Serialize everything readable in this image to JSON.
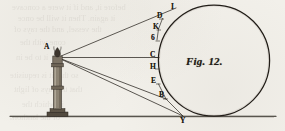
{
  "figure": {
    "caption": "Fig. 12",
    "caption_tail": ".",
    "domain_kind": "engraved-optics-diagram",
    "colors": {
      "paper": "#f2f0ea",
      "ink": "#1b1712",
      "ink_soft": "#3a322a",
      "bleed": "#4a3f34"
    },
    "canvas": {
      "width": 285,
      "height": 131
    }
  },
  "point_labels": [
    {
      "id": "I",
      "text": "I",
      "x": 171,
      "y": 4,
      "role": "upper-ray-extension-terminus"
    },
    {
      "id": "D",
      "text": "D",
      "x": 157,
      "y": 14,
      "role": "upper-tangent-contact"
    },
    {
      "id": "K",
      "text": "K",
      "x": 153,
      "y": 25,
      "role": "chord-point-upper"
    },
    {
      "id": "G",
      "text": "6",
      "x": 151,
      "y": 37,
      "role": "chord-point-upper-mid"
    },
    {
      "id": "C",
      "text": "C",
      "x": 150,
      "y": 53,
      "role": "horizontal-axis-contact"
    },
    {
      "id": "H",
      "text": "H",
      "x": 150,
      "y": 65,
      "role": "chord-point-lower-mid"
    },
    {
      "id": "E",
      "text": "E",
      "x": 151,
      "y": 78,
      "role": "chord-point-lower"
    },
    {
      "id": "B",
      "text": "B",
      "x": 159,
      "y": 92,
      "role": "lower-tangent-contact"
    },
    {
      "id": "A",
      "text": "A",
      "x": 44,
      "y": 44,
      "role": "light-source-apex"
    },
    {
      "id": "Y",
      "text": "Y",
      "x": 180,
      "y": 118,
      "role": "ground-ray-terminus"
    }
  ],
  "elements": {
    "lighthouse": {
      "name": "lighthouse-tower",
      "base_x": 57,
      "base_y": 116,
      "top_y": 57
    },
    "flame": {
      "name": "flame",
      "x": 57,
      "y": 50
    },
    "ground_line": {
      "name": "ground-line",
      "x1": 10,
      "y1": 116,
      "x2": 276,
      "y2": 116
    },
    "circle": {
      "name": "globe-circle",
      "cx": 214,
      "cy": 63.5,
      "r": 55.5
    },
    "rays": [
      {
        "name": "ray-A-to-I",
        "from": "A",
        "to": "I"
      },
      {
        "name": "ray-A-to-C",
        "from": "A",
        "to": "C"
      },
      {
        "name": "ray-A-to-E",
        "from": "A",
        "to": "E"
      },
      {
        "name": "ray-A-to-Y",
        "from": "A",
        "to": "Y"
      }
    ]
  },
  "bleed_through_text": [
    {
      "text": "before it, and if it were a concave",
      "x": 12,
      "y": 2,
      "size": 8.5
    },
    {
      "text": "it again. Then it will be once",
      "x": 18,
      "y": 13,
      "size": 8.5
    },
    {
      "text": "the vessel, and the rays of",
      "x": 14,
      "y": 24,
      "size": 8.5
    },
    {
      "text": "cone with the",
      "x": 20,
      "y": 37,
      "size": 8.5
    },
    {
      "text": "it to be in",
      "x": 16,
      "y": 52,
      "size": 8.5
    },
    {
      "text": "so that it is requisite",
      "x": 10,
      "y": 70,
      "size": 8.5
    },
    {
      "text": "that the rays of light",
      "x": 14,
      "y": 84,
      "size": 8.5
    },
    {
      "text": "in which the",
      "x": 22,
      "y": 99,
      "size": 8.5
    },
    {
      "text": "of the lanthorn",
      "x": 10,
      "y": 112,
      "size": 8.5
    }
  ]
}
